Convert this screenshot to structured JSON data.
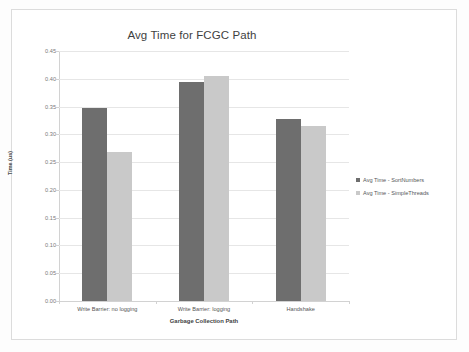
{
  "chart_data": {
    "type": "bar",
    "title": "Avg Time for FCGC Path",
    "xlabel": "Garbage Collection Path",
    "ylabel": "Time (us)",
    "categories": [
      "Write Barrier: no logging",
      "Write Barrier: logging",
      "Handshake"
    ],
    "series": [
      {
        "name": "Avg Time - SortNumbers",
        "color": "#6e6e6e",
        "values": [
          0.348,
          0.395,
          0.327
        ]
      },
      {
        "name": "Avg Time - SimpleThreads",
        "color": "#c9c9c9",
        "values": [
          0.268,
          0.405,
          0.315
        ]
      }
    ],
    "ylim": [
      0.0,
      0.45
    ],
    "ytick_step": 0.05,
    "ytick_labels": [
      "0.00",
      "0.05",
      "0.10",
      "0.15",
      "0.20",
      "0.25",
      "0.30",
      "0.35",
      "0.40",
      "0.45"
    ],
    "grid": true,
    "legend_position": "right"
  }
}
